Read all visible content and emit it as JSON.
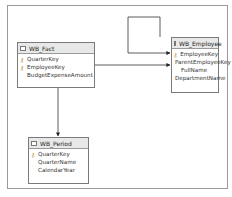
{
  "diagram": {
    "tables": [
      {
        "name": "WB_Fact",
        "columns": [
          {
            "label": "QuarterKey",
            "key": true
          },
          {
            "label": "EmployeeKey",
            "key": true
          },
          {
            "label": "BudgetExpenseAmount",
            "key": false
          }
        ]
      },
      {
        "name": "WB_Employee",
        "columns": [
          {
            "label": "EmployeeKey",
            "key": true
          },
          {
            "label": "ParentEmployeeKey",
            "key": false
          },
          {
            "label": "FullName",
            "key": false
          },
          {
            "label": "DepartmentName",
            "key": false
          }
        ]
      },
      {
        "name": "WB_Period",
        "columns": [
          {
            "label": "QuarterKey",
            "key": true
          },
          {
            "label": "QuarterName",
            "key": false
          },
          {
            "label": "CalendarYear",
            "key": false
          }
        ]
      }
    ],
    "relationships": [
      {
        "from": "WB_Fact.EmployeeKey",
        "to": "WB_Employee.ParentEmployeeKey"
      },
      {
        "from": "WB_Employee.ParentEmployeeKey",
        "to": "WB_Employee.EmployeeKey",
        "self_reference": true
      },
      {
        "from": "WB_Fact.QuarterKey",
        "to": "WB_Period.QuarterKey"
      }
    ],
    "icons": {
      "table": "table-icon",
      "key": "key-icon"
    },
    "colors": {
      "header_bg": "#e8e8e8",
      "border": "#7a7a7a",
      "line": "#333333",
      "key": "#b7a24a"
    }
  }
}
